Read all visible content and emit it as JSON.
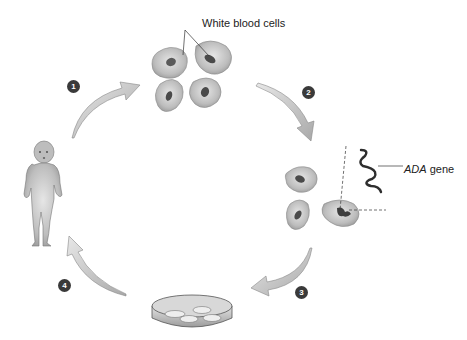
{
  "diagram": {
    "labels": {
      "white_blood_cells": "White blood cells",
      "ada_gene_italic": "ADA",
      "ada_gene_suffix": " gene"
    },
    "steps": [
      {
        "number": "1",
        "description": "White blood cells removed from patient"
      },
      {
        "number": "2",
        "description": "ADA gene inserted into cells"
      },
      {
        "number": "3",
        "description": "Modified cells grown in culture dish"
      },
      {
        "number": "4",
        "description": "Cells returned to patient"
      }
    ],
    "colors": {
      "cell_fill": "#b8b8b8",
      "cell_nucleus": "#555555",
      "arrow_fill": "#c8c8c8",
      "step_badge": "#3a3a3a",
      "gene_stroke": "#333333"
    }
  }
}
